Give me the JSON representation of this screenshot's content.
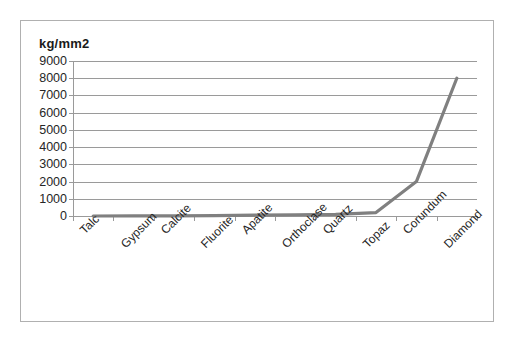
{
  "chart": {
    "axis_unit_label": "kg/mm2"
  },
  "chart_data": {
    "type": "line",
    "title": "",
    "subtitle": "",
    "xlabel": "",
    "ylabel": "kg/mm2",
    "categories": [
      "Talc",
      "Gypsum",
      "Calcite",
      "Fluorite",
      "Apatite",
      "Orthoclase",
      "Quartz",
      "Topaz",
      "Corundum",
      "Diamond"
    ],
    "values": [
      1,
      3,
      9,
      21,
      48,
      72,
      100,
      200,
      2000,
      8000
    ],
    "series": [
      {
        "name": "Hardness",
        "values": [
          1,
          3,
          9,
          21,
          48,
          72,
          100,
          200,
          2000,
          8000
        ],
        "color": "#808080"
      }
    ],
    "ylim": [
      0,
      9000
    ],
    "ytick_values": [
      0,
      1000,
      2000,
      3000,
      4000,
      5000,
      6000,
      7000,
      8000,
      9000
    ],
    "ytick_labels": [
      "0",
      "1000",
      "2000",
      "3000",
      "4000",
      "5000",
      "6000",
      "7000",
      "8000",
      "9000"
    ],
    "xtick_labels": [
      "Talc",
      "Gypsum",
      "Calcite",
      "Fluorite",
      "Apatite",
      "Orthoclase",
      "Quartz",
      "Topaz",
      "Corundum",
      "Diamond"
    ],
    "grid": true,
    "grid_axis": "y",
    "legend": false,
    "legend_position": "none",
    "annotations": [],
    "line_color": "#808080",
    "grid_color": "#9a9a9a",
    "background_color": "#ffffff",
    "border_color": "#b0b0b0",
    "xlabel_rotation_degrees": -45
  }
}
